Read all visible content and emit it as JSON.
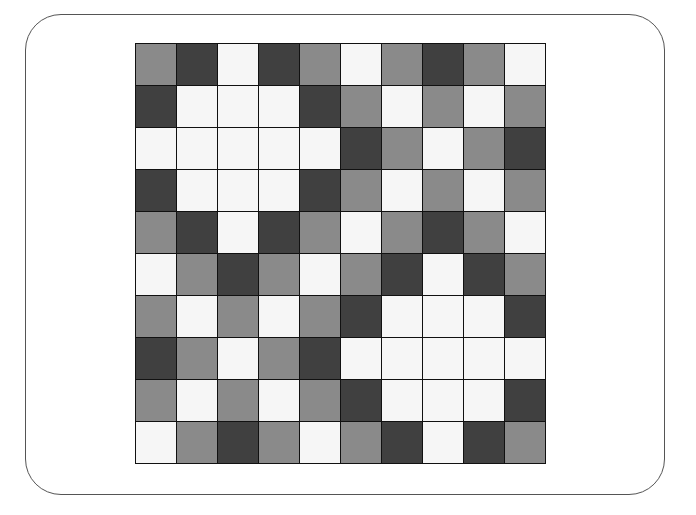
{
  "grid": {
    "rows": 10,
    "cols": 10,
    "legend": {
      "D": "dark",
      "M": "medium",
      "W": "white"
    },
    "colors": {
      "D": "#404040",
      "M": "#8a8a8a",
      "W": "#f6f6f6"
    },
    "cells": [
      [
        "M",
        "D",
        "W",
        "D",
        "M",
        "W",
        "M",
        "D",
        "M",
        "W"
      ],
      [
        "D",
        "W",
        "W",
        "W",
        "D",
        "M",
        "W",
        "M",
        "W",
        "M"
      ],
      [
        "W",
        "W",
        "W",
        "W",
        "W",
        "D",
        "M",
        "W",
        "M",
        "D"
      ],
      [
        "D",
        "W",
        "W",
        "W",
        "D",
        "M",
        "W",
        "M",
        "W",
        "M"
      ],
      [
        "M",
        "D",
        "W",
        "D",
        "M",
        "W",
        "M",
        "D",
        "M",
        "W"
      ],
      [
        "W",
        "M",
        "D",
        "M",
        "W",
        "M",
        "D",
        "W",
        "D",
        "M"
      ],
      [
        "M",
        "W",
        "M",
        "W",
        "M",
        "D",
        "W",
        "W",
        "W",
        "D"
      ],
      [
        "D",
        "M",
        "W",
        "M",
        "D",
        "W",
        "W",
        "W",
        "W",
        "W"
      ],
      [
        "M",
        "W",
        "M",
        "W",
        "M",
        "D",
        "W",
        "W",
        "W",
        "D"
      ],
      [
        "W",
        "M",
        "D",
        "M",
        "W",
        "M",
        "D",
        "W",
        "D",
        "M"
      ]
    ]
  }
}
